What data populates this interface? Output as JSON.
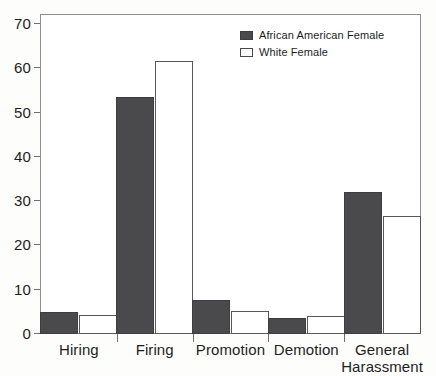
{
  "chart_data": {
    "type": "bar",
    "title": "",
    "subtitle": "",
    "xlabel": "",
    "ylabel": "",
    "ylim": [
      0,
      70
    ],
    "yticks": [
      0,
      10,
      20,
      30,
      40,
      50,
      60,
      70
    ],
    "ytick_labels": [
      "0",
      "10",
      "20",
      "30",
      "40",
      "50",
      "60",
      "70"
    ],
    "grid": false,
    "legend_position": "top-right",
    "categories": [
      "Hiring",
      "Firing",
      "Promotion",
      "Demotion",
      "General Harassment"
    ],
    "category_label_lines": [
      [
        "Hiring"
      ],
      [
        "Firing"
      ],
      [
        "Promotion"
      ],
      [
        "Demotion"
      ],
      [
        "General",
        "Harassment"
      ]
    ],
    "series": [
      {
        "name": "African American Female",
        "values": [
          5.0,
          53.5,
          7.7,
          3.6,
          32.0
        ],
        "color": "#4a4a4c",
        "style": "filled"
      },
      {
        "name": "White Female",
        "values": [
          4.3,
          61.7,
          5.3,
          4.1,
          26.7
        ],
        "color": "#ffffff",
        "style": "outlined"
      }
    ]
  },
  "legend": {
    "entries": [
      {
        "label": "African American Female",
        "swatch": "filled-dark-square-icon"
      },
      {
        "label": "White Female",
        "swatch": "outlined-white-square-icon"
      }
    ]
  },
  "colors": {
    "series_dark": "#4a4a4c",
    "series_light": "#ffffff",
    "outline": "#585858",
    "axis": "#6e6e6e",
    "frame": "#8e8e8e",
    "text": "#1d1d1d",
    "background": "#fdfdfc"
  }
}
